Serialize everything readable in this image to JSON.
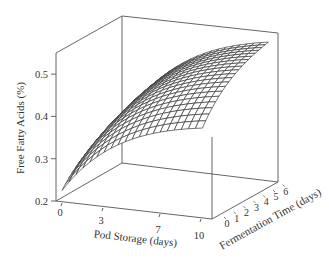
{
  "chart_data": {
    "type": "surface3d",
    "title": "",
    "xlabel": "Pod Storage (days)",
    "ylabel": "Fermentation Time (days)",
    "zlabel": "Free Fatty Acids (%)",
    "x_ticks": [
      0,
      3,
      7,
      10
    ],
    "y_ticks": [
      0,
      1,
      2,
      3,
      4,
      5,
      6
    ],
    "z_ticks": [
      "0.2",
      "0.3",
      "0.4",
      "0.5"
    ],
    "xlim": [
      0,
      10
    ],
    "ylim": [
      0,
      6
    ],
    "zlim": [
      0.2,
      0.55
    ],
    "grid_size": [
      20,
      20
    ],
    "surface_description": "FFA rises with pod storage and fermentation time, from ~0.23% at (0,0) toward a plateau ~0.53% at long storage/fermentation",
    "sample_points": [
      {
        "pod": 0,
        "ferm": 0,
        "ffa": 0.23
      },
      {
        "pod": 10,
        "ferm": 0,
        "ffa": 0.4
      },
      {
        "pod": 0,
        "ferm": 6,
        "ffa": 0.3
      },
      {
        "pod": 10,
        "ferm": 6,
        "ffa": 0.53
      }
    ],
    "line_color": "#3a3a3a",
    "box_color": "#555555"
  }
}
